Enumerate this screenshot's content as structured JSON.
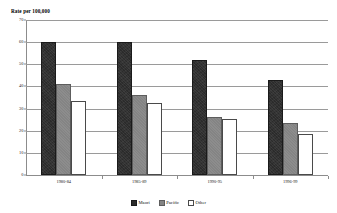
{
  "chart_data": {
    "type": "bar",
    "title": "",
    "ylabel": "Rate per 100,000",
    "xlabel": "",
    "ylim": [
      0,
      70
    ],
    "yticks": [
      0,
      10,
      20,
      30,
      40,
      50,
      60,
      70
    ],
    "grid": true,
    "legend_position": "bottom-center",
    "categories": [
      "1980-84",
      "1985-89",
      "1990-95",
      "1996-99"
    ],
    "series": [
      {
        "name": "Māori",
        "color": "#2b2b2b",
        "values": [
          60.0,
          60.0,
          52.0,
          43.0
        ]
      },
      {
        "name": "Pacific",
        "color": "#848484",
        "values": [
          41.0,
          36.0,
          26.0,
          23.5
        ]
      },
      {
        "name": "Other",
        "color": "#ffffff",
        "values": [
          33.5,
          32.5,
          25.5,
          18.5
        ]
      }
    ]
  },
  "colors": {
    "gridline": "#9a9a9a",
    "axis": "#8c8c8c",
    "background": "#ffffff",
    "text": "#000000"
  }
}
